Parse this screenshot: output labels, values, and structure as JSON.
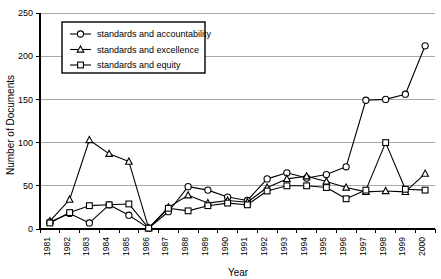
{
  "chart_data": {
    "type": "line",
    "title": "",
    "xlabel": "Year",
    "ylabel": "Number of Documents",
    "ylim": [
      0,
      250
    ],
    "ytick_step": 50,
    "yticks": [
      0,
      50,
      100,
      150,
      200,
      250
    ],
    "grid": true,
    "legend_position": "top-left-inside",
    "categories": [
      "1981",
      "1982",
      "1983",
      "1984",
      "1985",
      "1986",
      "1987",
      "1988",
      "1989",
      "1990",
      "1991",
      "1992",
      "1993",
      "1994",
      "1995",
      "1996",
      "1997",
      "1998",
      "1999",
      "2000"
    ],
    "series": [
      {
        "name": "standards and accountability",
        "marker": "circle",
        "values": [
          8,
          18,
          7,
          28,
          16,
          1,
          20,
          49,
          45,
          37,
          33,
          58,
          65,
          59,
          63,
          72,
          149,
          150,
          156,
          212
        ]
      },
      {
        "name": "standards and excellence",
        "marker": "triangle",
        "values": [
          9,
          34,
          103,
          87,
          78,
          1,
          25,
          39,
          30,
          33,
          31,
          48,
          58,
          61,
          55,
          48,
          43,
          44,
          43,
          64
        ]
      },
      {
        "name": "standards and equity",
        "marker": "square",
        "values": [
          7,
          19,
          27,
          28,
          29,
          1,
          24,
          21,
          27,
          30,
          28,
          44,
          50,
          50,
          48,
          35,
          45,
          100,
          46,
          45
        ]
      }
    ]
  },
  "legend": {
    "entries": [
      "standards and accountability",
      "standards and excellence",
      "standards and equity"
    ]
  },
  "axes": {
    "x_title": "Year",
    "y_title": "Number of Documents"
  }
}
